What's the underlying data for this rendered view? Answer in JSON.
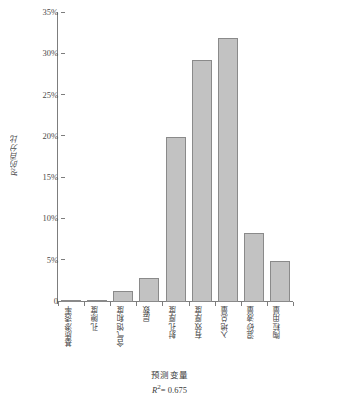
{
  "chart_data": {
    "type": "bar",
    "title": "",
    "subtitle": "",
    "xlabel": "预测变量",
    "ylabel": "R²的百分比",
    "annotation": "R²= 0.675",
    "annotation_symbol": "R",
    "annotation_exponent": "2",
    "annotation_value": "= 0.675",
    "ylim": [
      0,
      35
    ],
    "ytick_values": [
      0,
      5,
      10,
      15,
      20,
      25,
      30,
      35
    ],
    "ytick_labels": [
      "0",
      "5%",
      "10%",
      "15%",
      "20%",
      "25%",
      "30%",
      "35%"
    ],
    "grid": false,
    "legend": "none",
    "bar_color": "#c2c2c2",
    "bar_border_color": "#8a8a8a",
    "axis_color": "#7d7d7d",
    "categories": [
      "基质渗透率",
      "孔隙度",
      "含气饱和度",
      "层数",
      "射孔厚度",
      "有效厚度",
      "入地总量",
      "混砂液量",
      "陶粒用量"
    ],
    "values": [
      0.1,
      0.3,
      1.3,
      2.9,
      20.0,
      29.3,
      32.0,
      8.4,
      5.0
    ],
    "value_labels": [
      "0.1%",
      "0.3%",
      "1.3%",
      "2.9%",
      "20%",
      "29.3%",
      "32%",
      "8.4%",
      "5%"
    ]
  }
}
